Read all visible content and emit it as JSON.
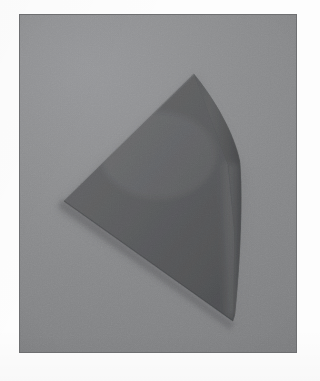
{
  "image": {
    "kind": "photograph",
    "caption": "Photograph of a gray cone-shaped solid resting on a flat gray surface",
    "alt_text": "A matte gray partial cone / wedge object photographed from above against a plain gray background",
    "canvas": {
      "width": 320,
      "height": 381
    },
    "frame": {
      "margin_color": "#fdfdfd",
      "plate_border_color": "#6f7072",
      "plate": {
        "x": 19,
        "y": 14,
        "width": 278,
        "height": 339
      }
    },
    "colors": {
      "background_light": "#96979a",
      "background_mid": "#8a8b8c",
      "background_dark": "#7f8082",
      "object_front_face": "#5c5d5f",
      "object_front_face_dark": "#535456",
      "object_curved_face": "#525355",
      "object_curved_face_dark": "#4a4b4d",
      "object_highlight_edge": "#6b6c6e",
      "contact_shadow": "#6c6d6f"
    },
    "object": {
      "name": "cone-solid",
      "apex": {
        "x": 193,
        "y": 73
      },
      "left_vertex": {
        "x": 63,
        "y": 200
      },
      "bottom_vertex": {
        "x": 232,
        "y": 320
      },
      "right_bulge": {
        "x": 241,
        "y": 180
      },
      "crease": {
        "top_x": 237,
        "top_y": 155,
        "bottom_x": 232,
        "bottom_y": 318
      }
    }
  }
}
